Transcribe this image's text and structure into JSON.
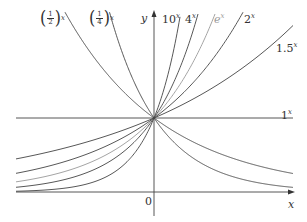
{
  "chart_data": {
    "type": "line",
    "title": "",
    "xlabel": "x",
    "ylabel": "y",
    "origin_label": "0",
    "xlim": [
      -2,
      2
    ],
    "ylim": [
      0,
      2.43
    ],
    "grid": false,
    "legend": "inline labels",
    "series": [
      {
        "name": "(1/2)^x",
        "base": 0.5,
        "color": "#444444"
      },
      {
        "name": "(1/4)^x",
        "base": 0.25,
        "color": "#444444"
      },
      {
        "name": "10^x",
        "base": 10,
        "color": "#444444"
      },
      {
        "name": "4^x",
        "base": 4,
        "color": "#444444"
      },
      {
        "name": "e^x",
        "base": 2.71828,
        "color": "#9a9a9a"
      },
      {
        "name": "2^x",
        "base": 2,
        "color": "#444444"
      },
      {
        "name": "1.5^x",
        "base": 1.5,
        "color": "#444444"
      },
      {
        "name": "1^x",
        "base": 1,
        "color": "#444444"
      }
    ],
    "common_point": [
      0,
      1
    ]
  },
  "labels": {
    "y_axis": "y",
    "x_axis": "x",
    "origin": "0",
    "half": {
      "num": "1",
      "den": "2",
      "exp": "x"
    },
    "quarter": {
      "num": "1",
      "den": "4",
      "exp": "x"
    },
    "ten": {
      "base": "10",
      "exp": "x"
    },
    "four": {
      "base": "4",
      "exp": "x"
    },
    "e": {
      "base": "e",
      "exp": "x"
    },
    "two": {
      "base": "2",
      "exp": "x"
    },
    "onehalf": {
      "base": "1.5",
      "exp": "x"
    },
    "one": {
      "base": "1",
      "exp": "x"
    }
  },
  "layout": {
    "origin_px": [
      154,
      192
    ],
    "unit_x": 69.5,
    "unit_y": 74,
    "left_px": 16,
    "right_px": 293,
    "top_px": 12
  }
}
